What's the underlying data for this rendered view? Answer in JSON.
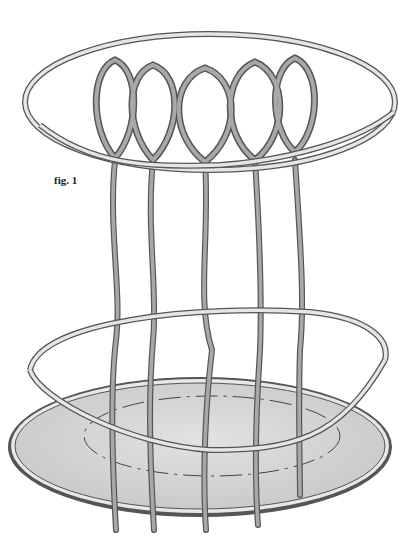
{
  "figure": {
    "label": "fig. 1"
  },
  "colors": {
    "background": "#ffffff",
    "rod_fill": "#a8a8a8",
    "rod_outline": "#555555",
    "hoop_fill": "#e6e6e6",
    "base_fill": "#d4d4d4",
    "base_dash": "#444444"
  },
  "parts": {
    "stakes": 5,
    "hoops": [
      "top hoop",
      "lower hoop"
    ],
    "base": "oval base disc with dashed inner guide"
  }
}
